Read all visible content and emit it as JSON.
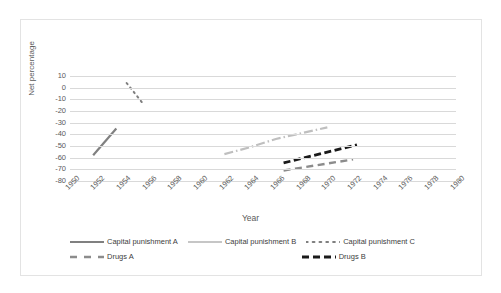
{
  "chart_data": {
    "type": "line",
    "title": "",
    "xlabel": "Year",
    "ylabel": "Net percentage",
    "xlim": [
      1950,
      1980
    ],
    "ylim": [
      -80,
      10
    ],
    "grid": true,
    "legend_position": "bottom",
    "x_ticks": [
      "1950",
      "1952",
      "1954",
      "1956",
      "1958",
      "1960",
      "1962",
      "1964",
      "1966",
      "1968",
      "1970",
      "1972",
      "1974",
      "1976",
      "1978",
      "1980"
    ],
    "y_ticks": [
      "10",
      "0",
      "-10",
      "-20",
      "-30",
      "-40",
      "-50",
      "-60",
      "-70",
      "-80"
    ],
    "series": [
      {
        "name": "Capital punishment A",
        "style": "solid",
        "color": "#808080",
        "points": [
          {
            "x": 1951.8,
            "y": -58
          },
          {
            "x": 1953.6,
            "y": -35
          }
        ]
      },
      {
        "name": "Capital punishment B",
        "style": "dash-dot",
        "color": "#bfbfbf",
        "points": [
          {
            "x": 1962.0,
            "y": -57
          },
          {
            "x": 1964.0,
            "y": -51
          },
          {
            "x": 1966.0,
            "y": -44
          },
          {
            "x": 1967.6,
            "y": -40
          },
          {
            "x": 1970.0,
            "y": -34
          }
        ]
      },
      {
        "name": "Capital punishment C",
        "style": "dotted",
        "color": "#7f7f7f",
        "points": [
          {
            "x": 1954.4,
            "y": 4
          },
          {
            "x": 1955.7,
            "y": -14
          }
        ]
      },
      {
        "name": "Drugs A",
        "style": "dashed",
        "color": "#8c8c8c",
        "points": [
          {
            "x": 1966.6,
            "y": -71
          },
          {
            "x": 1972.0,
            "y": -61.5
          }
        ]
      },
      {
        "name": "Drugs B",
        "style": "dashed-bold",
        "color": "#1a1a1a",
        "points": [
          {
            "x": 1966.6,
            "y": -64.5
          },
          {
            "x": 1972.3,
            "y": -49
          }
        ]
      }
    ]
  },
  "legend": {
    "rows": [
      [
        {
          "label": "Capital punishment A",
          "swatch": "solid-gray"
        },
        {
          "label": "Capital punishment B",
          "swatch": "solid-light-gray"
        },
        {
          "label": "Capital punishment C",
          "swatch": "dotted-gray"
        }
      ],
      [
        {
          "label": "Drugs A",
          "swatch": "dashed-gray"
        },
        {
          "label": "Drugs B",
          "swatch": "dashed-black"
        }
      ]
    ]
  },
  "colors": {
    "gridline": "#d9d9d9",
    "axis_text": "#595959",
    "border": "#e3e3e3",
    "background": "#ffffff"
  }
}
